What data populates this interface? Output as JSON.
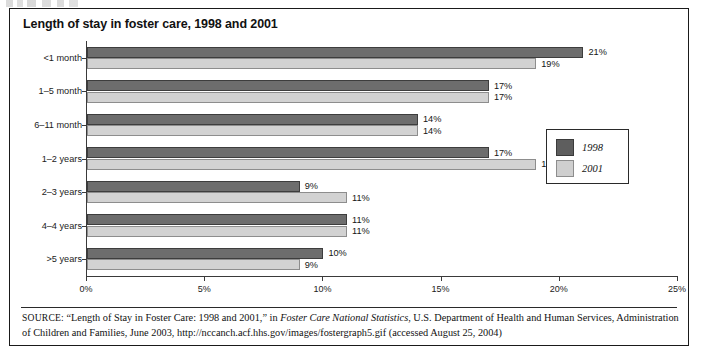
{
  "figure": {
    "title": "Length of stay in foster care, 1998 and 2001"
  },
  "source": {
    "label": "SOURCE:",
    "text_before_italic": " “Length of Stay in Foster Care: 1998 and 2001,” in ",
    "italic_title": "Foster Care National Statistics",
    "text_after_italic": ", U.S. Department of Health and Human Services, Administration of Children and Families, June 2003, http://nccanch.acf.hhs.gov/images/fostergraph5.gif (accessed August 25, 2004)"
  },
  "legend": {
    "position": "right-middle",
    "entries": [
      {
        "label": "1998",
        "color": "#5e5e5e"
      },
      {
        "label": "2001",
        "color": "#cfcfcf"
      }
    ]
  },
  "colors": {
    "series_1998": "#6d6d6d",
    "series_2001": "#d2d2d2",
    "axis": "#3a3a3a",
    "border": "#1a1a1a",
    "text": "#111111"
  },
  "chart_data": {
    "type": "bar",
    "orientation": "horizontal",
    "title": "Length of stay in foster care, 1998 and 2001",
    "xlabel": "",
    "ylabel": "",
    "xlim": [
      0,
      25
    ],
    "xticks": [
      0,
      5,
      10,
      15,
      20,
      25
    ],
    "xtick_labels": [
      "0%",
      "5%",
      "10%",
      "15%",
      "20%",
      "25%"
    ],
    "grid": false,
    "value_suffix": "%",
    "categories": [
      "<1 month",
      "1–5 month",
      "6–11 month",
      "1–2 years",
      "2–3 years",
      "4–4 years",
      ">5 years"
    ],
    "series": [
      {
        "name": "1998",
        "color": "#6d6d6d",
        "values": [
          21,
          17,
          14,
          17,
          9,
          11,
          10
        ],
        "labels": [
          "21%",
          "17%",
          "14%",
          "17%",
          "9%",
          "11%",
          "10%"
        ]
      },
      {
        "name": "2001",
        "color": "#d2d2d2",
        "values": [
          19,
          17,
          14,
          19,
          11,
          11,
          9
        ],
        "labels": [
          "19%",
          "17%",
          "14%",
          "19%",
          "11%",
          "11%",
          "9%"
        ]
      }
    ]
  }
}
